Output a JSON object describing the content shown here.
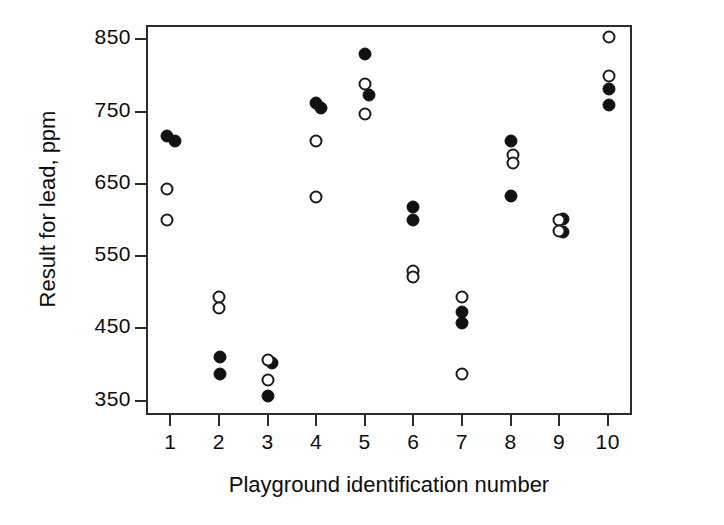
{
  "chart_data": {
    "type": "scatter",
    "title": "",
    "xlabel": "Playground identification number",
    "ylabel": "Result for lead, ppm",
    "xlim": [
      0.5,
      10.5
    ],
    "ylim": [
      330,
      870
    ],
    "grid": false,
    "legend": "none",
    "xticks": [
      "1",
      "2",
      "3",
      "4",
      "5",
      "6",
      "7",
      "8",
      "9",
      "10"
    ],
    "xtick_values": [
      1,
      2,
      3,
      4,
      5,
      6,
      7,
      8,
      9,
      10
    ],
    "yticks": [
      "350",
      "450",
      "550",
      "650",
      "750",
      "850"
    ],
    "ytick_values": [
      350,
      450,
      550,
      650,
      750,
      850
    ],
    "marker_styles": {
      "filled": "solid black circle",
      "open": "open white circle with black outline"
    },
    "series": [
      {
        "name": "filled",
        "marker": "filled-circle",
        "color": "#111111",
        "points": [
          {
            "x": 0.94,
            "y": 716
          },
          {
            "x": 1.09,
            "y": 710
          },
          {
            "x": 2.02,
            "y": 410
          },
          {
            "x": 2.02,
            "y": 387
          },
          {
            "x": 3.1,
            "y": 402
          },
          {
            "x": 3.0,
            "y": 357
          },
          {
            "x": 4.0,
            "y": 762
          },
          {
            "x": 4.1,
            "y": 755
          },
          {
            "x": 5.0,
            "y": 830
          },
          {
            "x": 5.09,
            "y": 773
          },
          {
            "x": 6.0,
            "y": 618
          },
          {
            "x": 6.0,
            "y": 600
          },
          {
            "x": 7.0,
            "y": 472
          },
          {
            "x": 7.0,
            "y": 457
          },
          {
            "x": 8.0,
            "y": 710
          },
          {
            "x": 8.0,
            "y": 633
          },
          {
            "x": 9.09,
            "y": 601
          },
          {
            "x": 9.09,
            "y": 584
          },
          {
            "x": 10.03,
            "y": 781
          },
          {
            "x": 10.03,
            "y": 759
          }
        ]
      },
      {
        "name": "open",
        "marker": "open-circle",
        "color": "#1a1a1a",
        "points": [
          {
            "x": 0.94,
            "y": 643
          },
          {
            "x": 0.94,
            "y": 600
          },
          {
            "x": 2.0,
            "y": 493
          },
          {
            "x": 2.0,
            "y": 478
          },
          {
            "x": 3.0,
            "y": 406
          },
          {
            "x": 3.0,
            "y": 378
          },
          {
            "x": 4.0,
            "y": 710
          },
          {
            "x": 4.0,
            "y": 632
          },
          {
            "x": 5.0,
            "y": 789
          },
          {
            "x": 5.0,
            "y": 747
          },
          {
            "x": 6.0,
            "y": 530
          },
          {
            "x": 6.0,
            "y": 521
          },
          {
            "x": 7.0,
            "y": 494
          },
          {
            "x": 7.0,
            "y": 387
          },
          {
            "x": 8.06,
            "y": 690
          },
          {
            "x": 8.06,
            "y": 679
          },
          {
            "x": 9.0,
            "y": 600
          },
          {
            "x": 9.0,
            "y": 585
          },
          {
            "x": 10.03,
            "y": 853
          },
          {
            "x": 10.03,
            "y": 800
          }
        ]
      }
    ]
  }
}
